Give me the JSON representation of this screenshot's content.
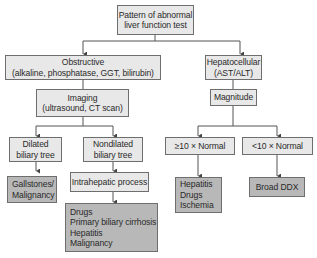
{
  "diagram": {
    "type": "flowchart",
    "nodes": {
      "root": {
        "lines": [
          "Pattern of abnormal",
          "liver function test"
        ]
      },
      "obstructive": {
        "lines": [
          "Obstructive",
          "(alkaline, phosphatase, GGT, bilirubin)"
        ]
      },
      "hepatocellular": {
        "lines": [
          "Hepatocellular",
          "(AST/ALT)"
        ]
      },
      "imaging": {
        "lines": [
          "Imaging",
          "(ultrasound, CT scan)"
        ]
      },
      "magnitude": {
        "lines": [
          "Magnitude"
        ]
      },
      "dilated": {
        "lines": [
          "Dilated",
          "biliary tree"
        ]
      },
      "nondilated": {
        "lines": [
          "Nondilated",
          "biliary tree"
        ]
      },
      "gallstones": {
        "lines": [
          "Gallstones/",
          "Malignancy"
        ]
      },
      "intrahepatic": {
        "lines": [
          "Intrahepatic process"
        ]
      },
      "intrahepatic_causes": {
        "lines": [
          "Drugs",
          "Primary biliary cirrhosis",
          "Hepatitis",
          "Malignancy"
        ]
      },
      "ge10": {
        "lines": [
          "≥10 × Normal"
        ]
      },
      "lt10": {
        "lines": [
          "<10 × Normal"
        ]
      },
      "ge10_causes": {
        "lines": [
          "Hepatitis",
          "Drugs",
          "Ischemia"
        ]
      },
      "broad": {
        "lines": [
          "Broad DDX"
        ]
      }
    },
    "edges": [
      [
        "root",
        "obstructive"
      ],
      [
        "root",
        "hepatocellular"
      ],
      [
        "obstructive",
        "imaging"
      ],
      [
        "hepatocellular",
        "magnitude"
      ],
      [
        "imaging",
        "dilated"
      ],
      [
        "imaging",
        "nondilated"
      ],
      [
        "dilated",
        "gallstones"
      ],
      [
        "nondilated",
        "intrahepatic"
      ],
      [
        "intrahepatic",
        "intrahepatic_causes"
      ],
      [
        "magnitude",
        "ge10"
      ],
      [
        "magnitude",
        "lt10"
      ],
      [
        "ge10",
        "ge10_causes"
      ],
      [
        "lt10",
        "broad"
      ]
    ]
  },
  "colors": {
    "light_fill": "#e8e8e8",
    "dark_fill": "#b8b8b8",
    "border": "#6e6e6e",
    "line": "#555555"
  }
}
